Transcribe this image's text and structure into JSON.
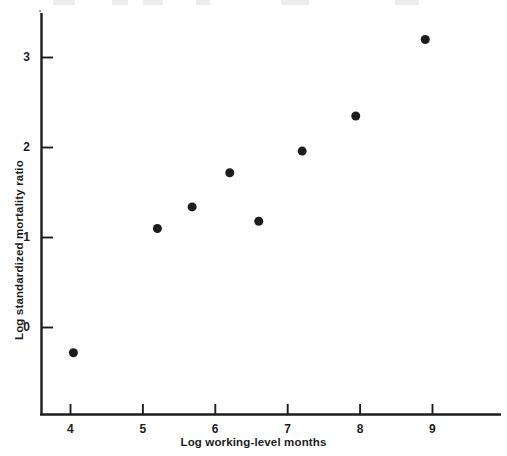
{
  "chart_data": {
    "type": "scatter",
    "title": "",
    "xlabel": "Log working-level months",
    "ylabel": "Log standardized mortality ratio",
    "xlim": [
      3.6,
      9.95
    ],
    "ylim": [
      -0.98,
      3.6
    ],
    "xticks": [
      4,
      5,
      6,
      7,
      8,
      9
    ],
    "xtick_labels": [
      "4",
      "5",
      "6",
      "7",
      "8",
      "9"
    ],
    "yticks": [
      0,
      1,
      2,
      3
    ],
    "ytick_labels": [
      "0",
      "1",
      "2",
      "3"
    ],
    "grid": false,
    "legend": false,
    "marker": "filled-circle",
    "marker_color": "#1d1d1d",
    "marker_size": 9,
    "x": [
      4.04,
      5.2,
      5.68,
      6.2,
      6.6,
      7.2,
      7.94,
      8.9
    ],
    "y": [
      -0.28,
      1.1,
      1.34,
      1.72,
      1.18,
      1.96,
      2.35,
      3.2
    ],
    "points": [
      {
        "x": 4.04,
        "y": -0.28
      },
      {
        "x": 5.2,
        "y": 1.1
      },
      {
        "x": 5.68,
        "y": 1.34
      },
      {
        "x": 6.2,
        "y": 1.72
      },
      {
        "x": 6.6,
        "y": 1.18
      },
      {
        "x": 7.2,
        "y": 1.96
      },
      {
        "x": 7.94,
        "y": 2.35
      },
      {
        "x": 8.9,
        "y": 3.2
      }
    ]
  },
  "axes": {
    "line_color": "#1d1d1d",
    "y_axis_label": "Log standardized mortality ratio",
    "x_axis_label": "Log working-level months",
    "y_tick_values": [
      "3",
      "2",
      "1",
      "0"
    ],
    "x_tick_values": [
      "4",
      "5",
      "6",
      "7",
      "8",
      "9"
    ]
  }
}
